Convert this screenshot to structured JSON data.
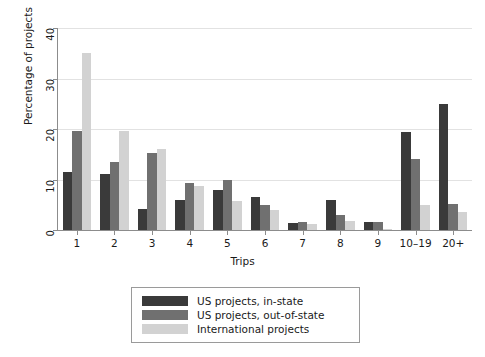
{
  "chart_data": {
    "type": "bar",
    "title": "",
    "xlabel": "Trips",
    "ylabel": "Percentage of projects",
    "categories": [
      "1",
      "2",
      "3",
      "4",
      "5",
      "6",
      "7",
      "8",
      "9",
      "10–19",
      "20+"
    ],
    "ylim": [
      0,
      40
    ],
    "yticks": [
      0,
      10,
      20,
      30,
      40
    ],
    "ytick_labels": [
      "0",
      "10",
      "20",
      "30",
      "40"
    ],
    "grid": true,
    "legend_position": "below-plot",
    "series": [
      {
        "name": "US projects, in-state",
        "color": "#3a3a3a",
        "values": [
          11.5,
          11.0,
          4.2,
          6.0,
          8.0,
          6.5,
          1.3,
          6.0,
          1.5,
          19.5,
          25.0
        ]
      },
      {
        "name": "US projects, out-of-state",
        "color": "#707070",
        "values": [
          19.7,
          13.5,
          15.3,
          9.3,
          10.0,
          5.0,
          1.5,
          3.0,
          1.5,
          14.0,
          5.2
        ]
      },
      {
        "name": "International projects",
        "color": "#d2d2d2",
        "values": [
          35.0,
          19.7,
          16.0,
          8.7,
          5.7,
          4.0,
          1.2,
          1.7,
          0.2,
          5.0,
          3.5
        ]
      }
    ]
  }
}
